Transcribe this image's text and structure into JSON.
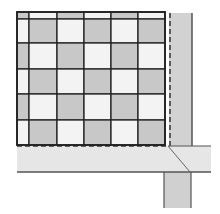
{
  "diagram": {
    "type": "tile-layout-plan",
    "colors": {
      "tile_dark": "#c8c8c8",
      "tile_light": "#f3f3f3",
      "strip_right": "#d2d2d2",
      "strip_bottom": "#e6e6e6",
      "strip_lower": "#d0d0d0",
      "outline": "#222222",
      "strip_edge": "#555555"
    },
    "grid": {
      "col_edges": [
        17,
        29,
        57,
        84,
        111,
        138,
        165
      ],
      "row_edges": [
        12,
        19,
        43,
        69,
        94,
        120,
        145
      ],
      "pattern": "checkerboard",
      "first_cell": "dark"
    },
    "strips": {
      "right_vertical": {
        "x": 169,
        "y": 13,
        "w": 23,
        "h": 133,
        "dashed_edge": "left"
      },
      "bottom_horizontal": {
        "x": 17,
        "y": 146,
        "w": 194,
        "h": 26,
        "dashed_edge": "top"
      },
      "lower_vertical": {
        "x": 164,
        "y": 172,
        "w": 27,
        "h": 36
      }
    },
    "miter_line": {
      "x1": 168,
      "y1": 146,
      "x2": 190,
      "y2": 172
    }
  }
}
